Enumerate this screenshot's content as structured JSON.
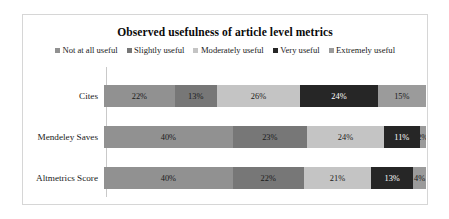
{
  "chart_data": {
    "type": "bar",
    "orientation": "horizontal",
    "stacked": true,
    "normalized_percent": true,
    "title": "Observed usefulness of article level metrics",
    "xlabel": "",
    "ylabel": "",
    "xlim": [
      0,
      100
    ],
    "grid": false,
    "legend_position": "top",
    "categories": [
      "Cites",
      "Mendeley Saves",
      "Altmetrics Score"
    ],
    "series": [
      {
        "name": "Not at all useful",
        "color": "#919191",
        "text_color": "#1a1a1a",
        "values": [
          22,
          40,
          40
        ],
        "labels": [
          "22%",
          "40%",
          "40%"
        ]
      },
      {
        "name": "Slightly useful",
        "color": "#777777",
        "text_color": "#1a1a1a",
        "values": [
          13,
          23,
          22
        ],
        "labels": [
          "13%",
          "23%",
          "22%"
        ]
      },
      {
        "name": "Moderately useful",
        "color": "#c4c4c4",
        "text_color": "#1a1a1a",
        "values": [
          26,
          24,
          21
        ],
        "labels": [
          "26%",
          "24%",
          "21%"
        ]
      },
      {
        "name": "Very useful",
        "color": "#262626",
        "text_color": "#ffffff",
        "values": [
          24,
          11,
          13
        ],
        "labels": [
          "24%",
          "11%",
          "13%"
        ]
      },
      {
        "name": "Extremely useful",
        "color": "#9b9b9b",
        "text_color": "#1a1a1a",
        "values": [
          15,
          2,
          4
        ],
        "labels": [
          "15%",
          "2%",
          "4%"
        ]
      }
    ],
    "rows": [
      {
        "category": "Cites",
        "segments": [
          {
            "series": "Not at all useful",
            "value": 22,
            "label": "22%",
            "color": "#919191",
            "text_color": "#1a1a1a"
          },
          {
            "series": "Slightly useful",
            "value": 13,
            "label": "13%",
            "color": "#777777",
            "text_color": "#1a1a1a"
          },
          {
            "series": "Moderately useful",
            "value": 26,
            "label": "26%",
            "color": "#c4c4c4",
            "text_color": "#1a1a1a"
          },
          {
            "series": "Very useful",
            "value": 24,
            "label": "24%",
            "color": "#262626",
            "text_color": "#ffffff"
          },
          {
            "series": "Extremely useful",
            "value": 15,
            "label": "15%",
            "color": "#9b9b9b",
            "text_color": "#1a1a1a"
          }
        ]
      },
      {
        "category": "Mendeley Saves",
        "segments": [
          {
            "series": "Not at all useful",
            "value": 40,
            "label": "40%",
            "color": "#919191",
            "text_color": "#1a1a1a"
          },
          {
            "series": "Slightly useful",
            "value": 23,
            "label": "23%",
            "color": "#777777",
            "text_color": "#1a1a1a"
          },
          {
            "series": "Moderately useful",
            "value": 24,
            "label": "24%",
            "color": "#c4c4c4",
            "text_color": "#1a1a1a"
          },
          {
            "series": "Very useful",
            "value": 11,
            "label": "11%",
            "color": "#262626",
            "text_color": "#ffffff"
          },
          {
            "series": "Extremely useful",
            "value": 2,
            "label": "2%",
            "color": "#9b9b9b",
            "text_color": "#1a1a1a"
          }
        ]
      },
      {
        "category": "Altmetrics Score",
        "segments": [
          {
            "series": "Not at all useful",
            "value": 40,
            "label": "40%",
            "color": "#919191",
            "text_color": "#1a1a1a"
          },
          {
            "series": "Slightly useful",
            "value": 22,
            "label": "22%",
            "color": "#777777",
            "text_color": "#1a1a1a"
          },
          {
            "series": "Moderately useful",
            "value": 21,
            "label": "21%",
            "color": "#c4c4c4",
            "text_color": "#1a1a1a"
          },
          {
            "series": "Very useful",
            "value": 13,
            "label": "13%",
            "color": "#262626",
            "text_color": "#ffffff"
          },
          {
            "series": "Extremely useful",
            "value": 4,
            "label": "4%",
            "color": "#9b9b9b",
            "text_color": "#1a1a1a"
          }
        ]
      }
    ]
  }
}
